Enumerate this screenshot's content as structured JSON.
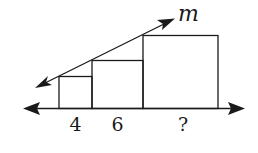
{
  "diagram": {
    "line_label": "m",
    "squares": [
      {
        "side_label": "4"
      },
      {
        "side_label": "6"
      },
      {
        "side_label": "?"
      }
    ]
  }
}
